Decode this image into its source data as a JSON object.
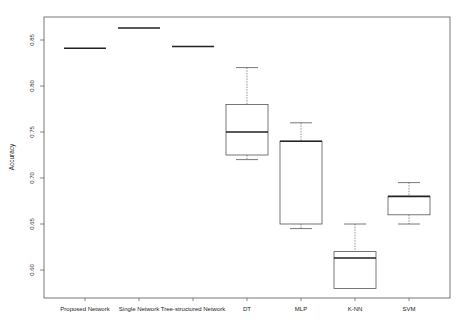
{
  "chart_data": {
    "type": "boxplot",
    "title": "",
    "xlabel": "",
    "ylabel": "Accuracy",
    "ylim": [
      0.565,
      0.875
    ],
    "yticks": [
      "0.60",
      "0.65",
      "0.70",
      "0.75",
      "0.80",
      "0.85"
    ],
    "ytick_values": [
      0.6,
      0.65,
      0.7,
      0.75,
      0.8,
      0.85
    ],
    "grid": false,
    "legend": null,
    "categories": [
      "Proposed Network",
      "Single Network",
      "Tree-structured Network",
      "DT",
      "MLP",
      "K-NN",
      "SVM"
    ],
    "boxes": [
      {
        "name": "Proposed Network",
        "min": 0.841,
        "q1": 0.841,
        "median": 0.841,
        "q3": 0.841,
        "max": 0.841
      },
      {
        "name": "Single Network",
        "min": 0.863,
        "q1": 0.863,
        "median": 0.863,
        "q3": 0.863,
        "max": 0.863
      },
      {
        "name": "Tree-structured Network",
        "min": 0.843,
        "q1": 0.843,
        "median": 0.843,
        "q3": 0.843,
        "max": 0.843
      },
      {
        "name": "DT",
        "min": 0.72,
        "q1": 0.725,
        "median": 0.75,
        "q3": 0.78,
        "max": 0.82
      },
      {
        "name": "MLP",
        "min": 0.645,
        "q1": 0.65,
        "median": 0.74,
        "q3": 0.74,
        "max": 0.76
      },
      {
        "name": "K-NN",
        "min": 0.58,
        "q1": 0.58,
        "median": 0.613,
        "q3": 0.62,
        "max": 0.65
      },
      {
        "name": "SVM",
        "min": 0.65,
        "q1": 0.66,
        "median": 0.68,
        "q3": 0.68,
        "max": 0.695
      }
    ]
  },
  "caption": "Fig. ..."
}
